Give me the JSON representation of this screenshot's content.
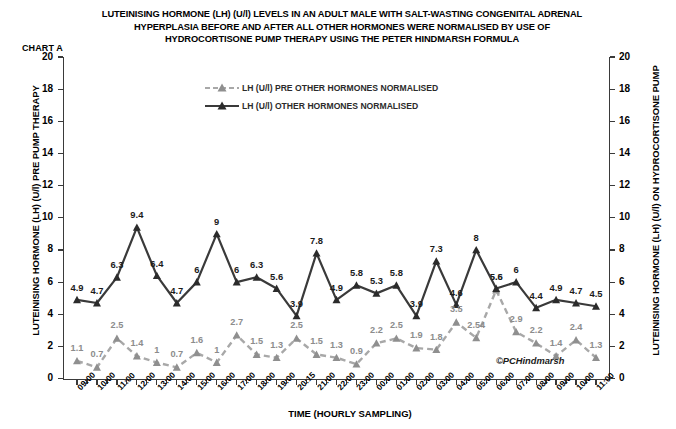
{
  "title": {
    "line1": "LUTEINISING HORMONE (LH) (U/l) LEVELS IN AN ADULT MALE WITH SALT-WASTING CONGENITAL ADRENAL",
    "line2": "HYPERPLASIA BEFORE AND AFTER ALL OTHER HORMONES WERE NORMALISED BY USE OF",
    "line3": "HYDROCORTISONE PUMP THERAPY USING THE PETER HINDMARSH FORMULA"
  },
  "chart_tag": "CHART A",
  "copyright": "©PCHindmarsh",
  "legend": {
    "position": "inside-top-center",
    "items": [
      {
        "label": "LH (U/l) PRE OTHER HORMONES NORMALISED",
        "color": "#a8a8a8",
        "dash": "dashed",
        "marker": "triangle"
      },
      {
        "label": "LH (U/l) OTHER HORMONES NORMALISED",
        "color": "#3a3a3a",
        "dash": "solid",
        "marker": "triangle"
      }
    ]
  },
  "chart_data": {
    "type": "line",
    "xlabel": "TIME (HOURLY SAMPLING)",
    "ylabel": "LUTEINISING HORMONE (LH) (U/l) PRE PUMP THERAPY",
    "ylabel_right": "LUTEINISING HORMONE (LH) (U/l) ON HYDROCORTISONE PUMP",
    "ylim": [
      0,
      20
    ],
    "yticks": [
      0,
      2,
      4,
      6,
      8,
      10,
      12,
      14,
      16,
      18,
      20
    ],
    "yticks_right": [
      0,
      2,
      4,
      6,
      8,
      10,
      12,
      14,
      16,
      18,
      20
    ],
    "grid": false,
    "categories": [
      "09:00",
      "10:00",
      "11:00",
      "12:00",
      "13:00",
      "14:00",
      "15:00",
      "16:00",
      "17:00",
      "18:00",
      "19:00",
      "20:15",
      "21:00",
      "22:00",
      "23:00",
      "00:00",
      "01:00",
      "02:00",
      "03:00",
      "04:00",
      "05:00",
      "06:00",
      "07:00",
      "08:00",
      "09:00",
      "10:00",
      "11:00"
    ],
    "series": [
      {
        "name": "LH (U/l) PRE OTHER HORMONES NORMALISED",
        "color": "#a8a8a8",
        "dash": "dashed",
        "values": [
          1.1,
          0.7,
          2.5,
          1.4,
          1,
          0.7,
          1.6,
          1,
          2.7,
          1.5,
          1.3,
          2.5,
          1.5,
          1.3,
          0.9,
          2.2,
          2.5,
          1.9,
          1.8,
          3.5,
          2.54,
          5.5,
          2.9,
          2.2,
          1.4,
          2.4,
          1.3
        ],
        "labels": [
          "1.1",
          "0.7",
          "2.5",
          "1.4",
          "1",
          "0.7",
          "1.6",
          "1",
          "2.7",
          "1.5",
          "1.3",
          "2.5",
          "1.5",
          "1.3",
          "0.9",
          "2.2",
          "2.5",
          "1.9",
          "1.8",
          "3.5",
          "2.54",
          "5.5",
          "2.9",
          "2.2",
          "1.4",
          "2.4",
          "1.3"
        ]
      },
      {
        "name": "LH (U/l) OTHER HORMONES NORMALISED",
        "color": "#3a3a3a",
        "dash": "solid",
        "values": [
          4.9,
          4.7,
          6.3,
          9.4,
          6.4,
          4.7,
          6,
          9,
          6,
          6.3,
          5.6,
          3.9,
          7.8,
          4.9,
          5.8,
          5.3,
          5.8,
          3.9,
          7.3,
          4.6,
          8,
          5.6,
          6,
          4.4,
          4.9,
          4.7,
          4.5
        ],
        "labels": [
          "4.9",
          "4.7",
          "6.3",
          "9.4",
          "6.4",
          "4.7",
          "6",
          "9",
          "6",
          "6.3",
          "5.6",
          "3.9",
          "7.8",
          "4.9",
          "5.8",
          "5.3",
          "5.8",
          "3.9",
          "7.3",
          "4.6",
          "8",
          "5.6",
          "6",
          "4.4",
          "4.9",
          "4.7",
          "4.5"
        ]
      }
    ]
  }
}
